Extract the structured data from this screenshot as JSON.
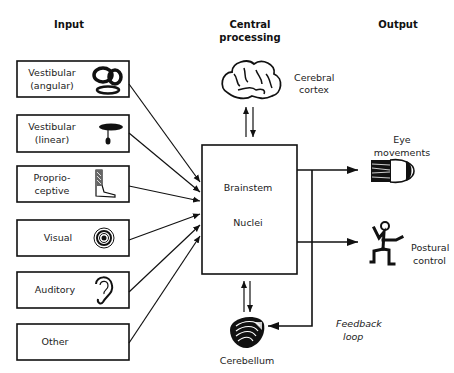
{
  "headers": {
    "input": "Input",
    "central_line1": "Central",
    "central_line2": "processing",
    "output": "Output"
  },
  "inputs": [
    {
      "line1": "Vestibular",
      "line2": "(angular)",
      "icon": "semicircular-canals-icon"
    },
    {
      "line1": "Vestibular",
      "line2": "(linear)",
      "icon": "otolith-icon"
    },
    {
      "line1": "Proprio-",
      "line2": "ceptive",
      "icon": "leg-muscle-icon"
    },
    {
      "line1": "Visual",
      "line2": "",
      "icon": "eye-target-icon"
    },
    {
      "line1": "Auditory",
      "line2": "",
      "icon": "ear-icon"
    },
    {
      "line1": "Other",
      "line2": "",
      "icon": ""
    }
  ],
  "central": {
    "box_line1": "Brainstem",
    "box_line2": "Nuclei",
    "cortex_line1": "Cerebral",
    "cortex_line2": "cortex",
    "cerebellum": "Cerebellum"
  },
  "outputs": [
    {
      "line1": "Eye",
      "line2": "movements",
      "icon": "eyeball-muscle-icon"
    },
    {
      "line1": "Postural",
      "line2": "control",
      "icon": "stick-figure-icon"
    }
  ],
  "feedback": {
    "line1": "Feedback",
    "line2": "loop"
  }
}
